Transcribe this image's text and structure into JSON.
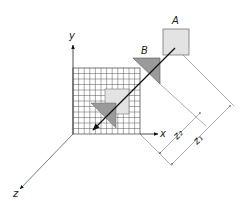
{
  "labels": {
    "A": "A",
    "B": "B",
    "x_axis": "x",
    "y_axis": "y",
    "z_axis": "z",
    "z2": "z₂",
    "z1": "z₁"
  },
  "colors": {
    "square_fill": "#e3e3e3",
    "triangle_fill": "#9a9a9a",
    "grid_line": "#555555",
    "dimension_line": "#8a8a8a",
    "ink": "#111111"
  }
}
